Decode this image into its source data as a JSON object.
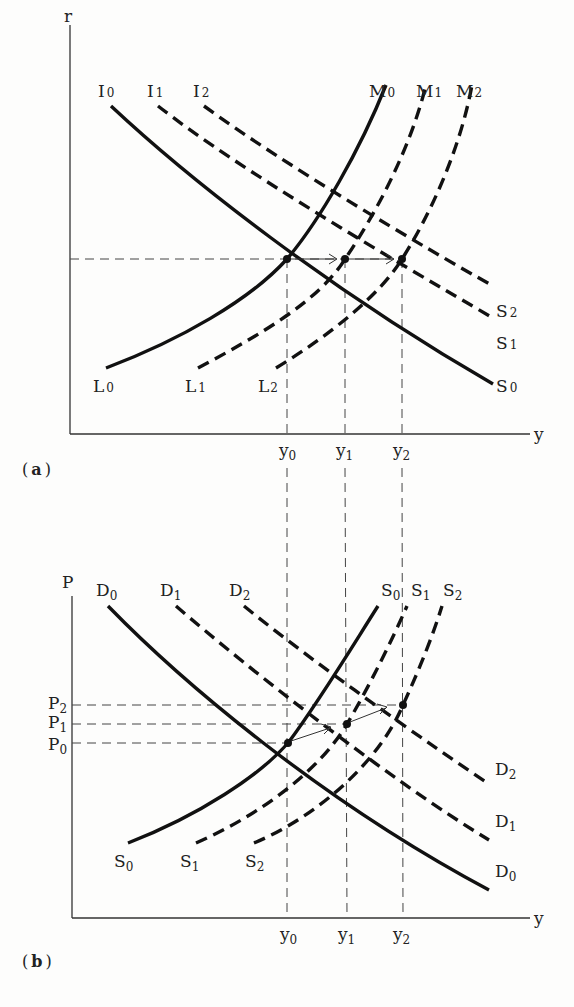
{
  "panel_a": {
    "label_open": "(",
    "label_letter": "a",
    "label_close": ")",
    "y_axis_label": "r",
    "x_axis_label": "y",
    "x_ticks": [
      {
        "base": "y",
        "sub": "0"
      },
      {
        "base": "y",
        "sub": "1"
      },
      {
        "base": "y",
        "sub": "2"
      }
    ],
    "curves": {
      "IS": [
        {
          "top_base": "I",
          "top_sub": "0",
          "bottom_base": "S",
          "bottom_sub": "0",
          "style": "solid"
        },
        {
          "top_base": "I",
          "top_sub": "1",
          "bottom_base": "S",
          "bottom_sub": "1",
          "style": "dashed"
        },
        {
          "top_base": "I",
          "top_sub": "2",
          "bottom_base": "S",
          "bottom_sub": "2",
          "style": "dashed"
        }
      ],
      "LM": [
        {
          "top_base": "M",
          "top_sub": "0",
          "bottom_base": "L",
          "bottom_sub": "0",
          "style": "solid"
        },
        {
          "top_base": "M",
          "top_sub": "1",
          "bottom_base": "L",
          "bottom_sub": "1",
          "style": "dashed"
        },
        {
          "top_base": "M",
          "top_sub": "2",
          "bottom_base": "L",
          "bottom_sub": "2",
          "style": "dashed"
        }
      ]
    }
  },
  "panel_b": {
    "label_open": "(",
    "label_letter": "b",
    "label_close": ")",
    "y_axis_label": "P",
    "x_axis_label": "y",
    "x_ticks": [
      {
        "base": "y",
        "sub": "0"
      },
      {
        "base": "y",
        "sub": "1"
      },
      {
        "base": "y",
        "sub": "2"
      }
    ],
    "y_ticks": [
      {
        "base": "P",
        "sub": "2"
      },
      {
        "base": "P",
        "sub": "1"
      },
      {
        "base": "P",
        "sub": "0"
      }
    ],
    "curves": {
      "AD": [
        {
          "top_base": "D",
          "top_sub": "0",
          "bottom_base": "D",
          "bottom_sub": "0",
          "style": "solid"
        },
        {
          "top_base": "D",
          "top_sub": "1",
          "bottom_base": "D",
          "bottom_sub": "1",
          "style": "dashed"
        },
        {
          "top_base": "D",
          "top_sub": "2",
          "bottom_base": "D",
          "bottom_sub": "2",
          "style": "dashed"
        }
      ],
      "AS": [
        {
          "top_base": "S",
          "top_sub": "0",
          "bottom_base": "S",
          "bottom_sub": "0",
          "style": "solid"
        },
        {
          "top_base": "S",
          "top_sub": "1",
          "bottom_base": "S",
          "bottom_sub": "1",
          "style": "dashed"
        },
        {
          "top_base": "S",
          "top_sub": "2",
          "bottom_base": "S",
          "bottom_sub": "2",
          "style": "dashed"
        }
      ]
    }
  }
}
